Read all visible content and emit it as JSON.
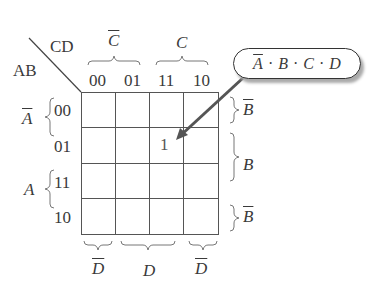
{
  "corner": {
    "col_var": "CD",
    "row_var": "AB"
  },
  "col_headers": [
    "00",
    "01",
    "11",
    "10"
  ],
  "row_headers": [
    "00",
    "01",
    "11",
    "10"
  ],
  "top_groups": [
    {
      "label": "C",
      "negated": true
    },
    {
      "label": "C",
      "negated": false
    }
  ],
  "left_groups": [
    {
      "label": "A",
      "negated": true
    },
    {
      "label": "A",
      "negated": false
    }
  ],
  "right_groups": [
    {
      "label": "B",
      "negated": true
    },
    {
      "label": "B",
      "negated": false
    },
    {
      "label": "B",
      "negated": true
    }
  ],
  "bottom_groups": [
    {
      "label": "D",
      "negated": true
    },
    {
      "label": "D",
      "negated": false
    },
    {
      "label": "D",
      "negated": true
    }
  ],
  "cells": [
    [
      "",
      "",
      "",
      ""
    ],
    [
      "",
      "",
      "1",
      ""
    ],
    [
      "",
      "",
      "",
      ""
    ],
    [
      "",
      "",
      "",
      ""
    ]
  ],
  "callout": {
    "terms": [
      "A",
      "B",
      "C",
      "D"
    ],
    "negated": [
      true,
      false,
      false,
      false
    ],
    "separator": "·",
    "points_to": "row 01, col 11"
  }
}
